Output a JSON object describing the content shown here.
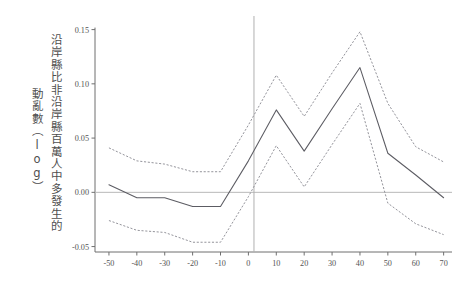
{
  "figure": {
    "background": "#ffffff",
    "axis_color": "#6f6f6f",
    "estimate_color": "#5c5c63",
    "ci_color": "#8e8e96",
    "zero_line_color": "#b9b9b9",
    "reference_line_color": "#b0b0b0"
  },
  "ylabel": {
    "column_1": "沿岸縣比非沿岸縣百萬人中多發生的",
    "column_2": "動亂數（log）"
  },
  "chart_data": {
    "type": "line",
    "title": "",
    "subtitle": "",
    "xlabel": "",
    "ylabel": "沿岸縣比非沿岸縣百萬人中多發生的動亂數（log）",
    "xlim": [
      -55,
      73
    ],
    "ylim": [
      -0.055,
      0.157
    ],
    "xticks": [
      -50,
      -40,
      -30,
      -20,
      -10,
      0,
      10,
      20,
      30,
      40,
      50,
      60,
      70
    ],
    "yticks": [
      -0.05,
      0.0,
      0.05,
      0.1,
      0.15
    ],
    "xtick_labels": [
      "-50",
      "-40",
      "-30",
      "-20",
      "-10",
      "0",
      "10",
      "20",
      "30",
      "40",
      "50",
      "60",
      "70"
    ],
    "ytick_labels": [
      "-0.05",
      "0.00",
      "0.05",
      "0.10",
      "0.15"
    ],
    "grid": false,
    "legend": null,
    "zero_line": 0.0,
    "reference_line_x": 2,
    "x": [
      -50,
      -40,
      -30,
      -20,
      -10,
      0,
      10,
      20,
      30,
      40,
      50,
      60,
      70
    ],
    "series": [
      {
        "name": "estimate",
        "style": "solid",
        "values": [
          0.007,
          -0.005,
          -0.005,
          -0.013,
          -0.013,
          0.029,
          0.076,
          0.038,
          0.077,
          0.115,
          0.036,
          0.016,
          -0.005
        ]
      },
      {
        "name": "upper_ci",
        "style": "dashed",
        "values": [
          0.041,
          0.029,
          0.026,
          0.019,
          0.019,
          0.062,
          0.108,
          0.07,
          0.11,
          0.148,
          0.082,
          0.042,
          0.028
        ]
      },
      {
        "name": "lower_ci",
        "style": "dashed",
        "values": [
          -0.026,
          -0.035,
          -0.037,
          -0.046,
          -0.046,
          -0.004,
          0.043,
          0.005,
          0.044,
          0.082,
          -0.01,
          -0.029,
          -0.039
        ]
      }
    ]
  }
}
